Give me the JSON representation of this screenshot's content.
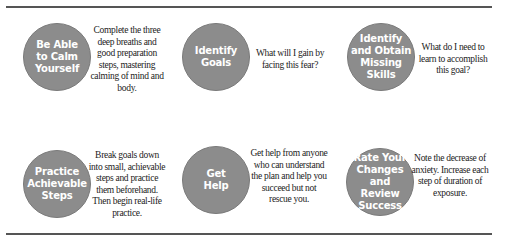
{
  "diagram": {
    "rule_color": "#555555",
    "circle_color": "#8c8c8c",
    "steps": [
      {
        "title": "Be Able\nto Calm\nYourself",
        "description": "Complete the three deep breaths and good preparation steps, mastering calming of mind and body."
      },
      {
        "title": "Identify\nGoals",
        "description": "What will I gain by facing this fear?"
      },
      {
        "title": "Identify\nand Obtain\nMissing\nSkills",
        "description": "What do I need to learn to accomplish this goal?"
      },
      {
        "title": "Practice\nAchievable\nSteps",
        "description": "Break goals down into small, achievable steps and practice them beforehand. Then begin real-life practice."
      },
      {
        "title": "Get\nHelp",
        "description": "Get help from anyone who can understand the plan and help you succeed but not rescue you."
      },
      {
        "title": "Rate Your\nChanges\nand Review\nSuccess",
        "description": "Note the decrease of anxiety. Increase each step of duration of exposure."
      }
    ]
  }
}
